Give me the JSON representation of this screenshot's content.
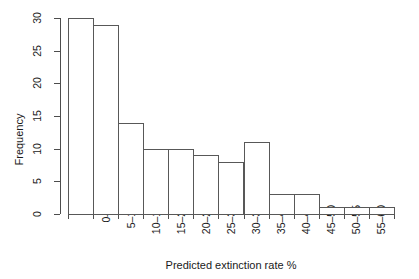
{
  "chart_data": {
    "type": "bar",
    "title": "",
    "subtitle": "",
    "xlabel": "Predicted extinction rate %",
    "ylabel": "Frequency",
    "categories": [
      "0",
      "0–5",
      "5–10",
      "10–15",
      "15–20",
      "20–25",
      "25–30",
      "30–35",
      "35–40",
      "40–45",
      "45–50",
      "50–55",
      "55–60"
    ],
    "values": [
      30,
      29,
      14,
      10,
      10,
      9,
      8,
      11,
      3,
      3,
      1,
      1,
      1
    ],
    "ylim": [
      0,
      30
    ],
    "yticks": [
      0,
      5,
      10,
      15,
      20,
      25,
      30
    ],
    "ytick_labels": [
      "0",
      "5",
      "10",
      "15",
      "20",
      "25",
      "30"
    ],
    "grid": false,
    "legend": false,
    "bar_fill": "#ffffff",
    "bar_border": "#585858",
    "axis_color": "#4d4d4d",
    "text_color": "#1a1a1a",
    "background": "#ffffff"
  }
}
